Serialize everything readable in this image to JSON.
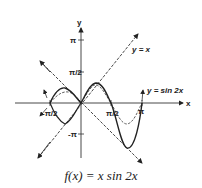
{
  "figure": {
    "caption": "f(x) = x sin 2x",
    "axes": {
      "x_label": "x",
      "y_label": "y",
      "x_ticks": [
        "-π/2",
        "π/2",
        "π"
      ],
      "y_ticks": [
        "π",
        "π/2",
        "-π"
      ]
    },
    "curves": [
      {
        "name": "y = x",
        "style": "dashed",
        "label": "y = x"
      },
      {
        "name": "y = -x",
        "style": "dashed"
      },
      {
        "name": "y = sin 2x",
        "style": "dashed-thin",
        "label": "y = sin 2x"
      },
      {
        "name": "f(x) = x sin 2x",
        "style": "solid"
      }
    ],
    "colors": {
      "ink": "#222222",
      "background": "#ffffff"
    }
  }
}
